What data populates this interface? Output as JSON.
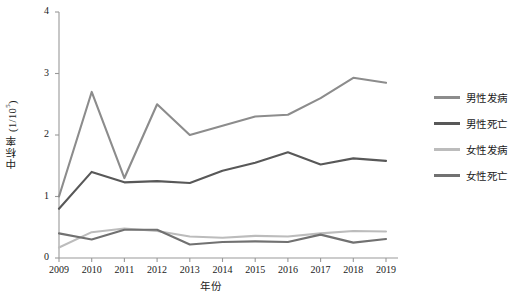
{
  "chart_data": {
    "type": "line",
    "title": "",
    "xlabel": "年份",
    "ylabel": "中标率 (1/10⁵)",
    "ylabel_base": "中标率 (1/10",
    "ylabel_exp": "5",
    "ylabel_tail": ")",
    "categories": [
      "2009",
      "2010",
      "2011",
      "2012",
      "2013",
      "2014",
      "2015",
      "2016",
      "2017",
      "2018",
      "2019"
    ],
    "x": [
      2009,
      2010,
      2011,
      2012,
      2013,
      2014,
      2015,
      2016,
      2017,
      2018,
      2019
    ],
    "xlim": [
      2009,
      2019
    ],
    "ylim": [
      0,
      4
    ],
    "yticks": [
      "0",
      "1",
      "2",
      "3",
      "4"
    ],
    "ytick_values": [
      0,
      1,
      2,
      3,
      4
    ],
    "grid": false,
    "legend_position": "right",
    "series": [
      {
        "name": "男性发病",
        "color": "#8c8c8c",
        "values": [
          1.0,
          2.7,
          1.3,
          2.5,
          2.0,
          2.15,
          2.3,
          2.33,
          2.6,
          2.93,
          2.85
        ]
      },
      {
        "name": "男性死亡",
        "color": "#585858",
        "values": [
          0.8,
          1.4,
          1.23,
          1.25,
          1.22,
          1.42,
          1.55,
          1.72,
          1.52,
          1.62,
          1.58
        ]
      },
      {
        "name": "女性发病",
        "color": "#bcbcbc",
        "values": [
          0.17,
          0.42,
          0.48,
          0.44,
          0.35,
          0.33,
          0.36,
          0.35,
          0.4,
          0.44,
          0.43
        ]
      },
      {
        "name": "女性死亡",
        "color": "#717171",
        "values": [
          0.4,
          0.3,
          0.46,
          0.46,
          0.22,
          0.26,
          0.27,
          0.26,
          0.38,
          0.25,
          0.31
        ]
      }
    ]
  },
  "axis": {
    "color": "#999999"
  }
}
